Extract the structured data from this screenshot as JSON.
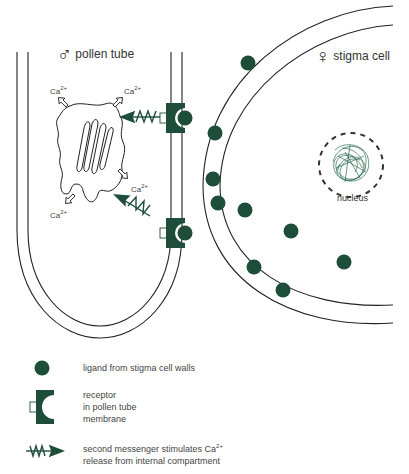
{
  "colors": {
    "green": "#1e4d3a",
    "line": "#222222",
    "text": "#333333"
  },
  "pollen_tube": {
    "symbol": "♂",
    "label": "pollen tube"
  },
  "stigma_cell": {
    "symbol": "♀",
    "label": "stigma cell"
  },
  "nucleus": {
    "label": "nucleus"
  },
  "calcium": {
    "base": "Ca",
    "charge": "2+",
    "labels": [
      {
        "id": "ca-top-left"
      },
      {
        "id": "ca-top-right"
      },
      {
        "id": "ca-bottom-right"
      },
      {
        "id": "ca-bottom-left"
      }
    ]
  },
  "legend": {
    "items": [
      {
        "icon": "ligand-icon",
        "lines": [
          "ligand from stigma cell walls"
        ]
      },
      {
        "icon": "receptor-icon",
        "lines": [
          "receptor",
          "in pollen tube",
          "membrane"
        ]
      },
      {
        "icon": "second-messenger-icon",
        "line1_prefix": "second messenger stimulates Ca",
        "line1_sup": "2+",
        "line2": "release from internal compartment"
      }
    ]
  }
}
